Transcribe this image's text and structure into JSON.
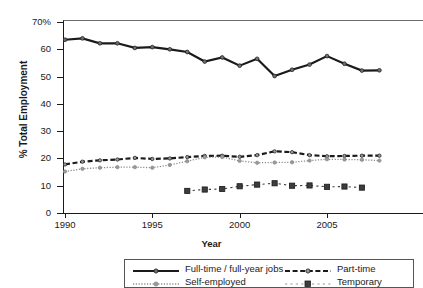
{
  "chart_data": {
    "type": "line",
    "title": "",
    "xlabel": "Year",
    "ylabel": "% Total Employment",
    "xlim": [
      1990,
      2008
    ],
    "ylim": [
      0,
      70
    ],
    "grid": false,
    "legend_position": "bottom",
    "x": [
      1990,
      1991,
      1992,
      1993,
      1994,
      1995,
      1996,
      1997,
      1998,
      1999,
      2000,
      2001,
      2002,
      2003,
      2004,
      2005,
      2006,
      2007,
      2008
    ],
    "yticks": [
      {
        "value": 70,
        "label": "70%"
      },
      {
        "value": 60,
        "label": "60"
      },
      {
        "value": 50,
        "label": "50"
      },
      {
        "value": 40,
        "label": "40"
      },
      {
        "value": 30,
        "label": "30"
      },
      {
        "value": 20,
        "label": "20"
      },
      {
        "value": 10,
        "label": "10"
      },
      {
        "value": 0,
        "label": "0"
      }
    ],
    "xticks": [
      {
        "value": 1990,
        "label": "1990"
      },
      {
        "value": 1995,
        "label": "1995"
      },
      {
        "value": 2000,
        "label": "2000"
      },
      {
        "value": 2005,
        "label": "2005"
      }
    ],
    "series": [
      {
        "name": "Full-time / full-year jobs",
        "style": "solid",
        "marker": "circle",
        "color": "#1a1a1a",
        "x": [
          1990,
          1991,
          1992,
          1993,
          1994,
          1995,
          1996,
          1997,
          1998,
          1999,
          2000,
          2001,
          2002,
          2003,
          2004,
          2005,
          2006,
          2007,
          2008
        ],
        "values": [
          63.5,
          64.0,
          62.2,
          62.2,
          60.5,
          60.8,
          60.0,
          59.0,
          55.5,
          57.0,
          54.0,
          56.5,
          50.2,
          52.5,
          54.4,
          57.5,
          54.7,
          52.2,
          52.3
        ]
      },
      {
        "name": "Part-time",
        "style": "dashed",
        "marker": "circle",
        "color": "#1a1a1a",
        "x": [
          1990,
          1991,
          1992,
          1993,
          1994,
          1995,
          1996,
          1997,
          1998,
          1999,
          2000,
          2001,
          2002,
          2003,
          2004,
          2005,
          2006,
          2007,
          2008
        ],
        "values": [
          17.8,
          18.8,
          19.3,
          19.6,
          20.2,
          19.8,
          20.0,
          20.5,
          20.9,
          21.0,
          20.6,
          21.2,
          22.6,
          22.3,
          21.2,
          20.8,
          20.9,
          21.0,
          21.0
        ]
      },
      {
        "name": "Self-employed",
        "style": "dotted",
        "marker": "circle",
        "color": "#8a8a8a",
        "x": [
          1990,
          1991,
          1992,
          1993,
          1994,
          1995,
          1996,
          1997,
          1998,
          1999,
          2000,
          2001,
          2002,
          2003,
          2004,
          2005,
          2006,
          2007,
          2008
        ],
        "values": [
          15.2,
          16.2,
          16.6,
          16.8,
          16.8,
          16.6,
          17.6,
          19.0,
          20.4,
          20.5,
          19.1,
          18.4,
          18.5,
          18.6,
          19.2,
          19.7,
          19.6,
          19.5,
          19.2
        ]
      },
      {
        "name": "Temporary",
        "style": "loose-dash",
        "marker": "square",
        "color": "#3d3d3d",
        "x": [
          1997,
          1998,
          1999,
          2000,
          2001,
          2002,
          2003,
          2004,
          2005,
          2006,
          2007
        ],
        "values": [
          8.1,
          8.6,
          8.8,
          9.8,
          10.4,
          10.9,
          10.0,
          10.1,
          9.6,
          9.7,
          9.3
        ]
      }
    ]
  },
  "legend": {
    "items": [
      {
        "label": "Full-time / full-year jobs",
        "key": "solid-circle"
      },
      {
        "label": "Part-time",
        "key": "dashed-circle"
      },
      {
        "label": "Self-employed",
        "key": "dotted-circle"
      },
      {
        "label": "Temporary",
        "key": "loose-dash-square"
      }
    ]
  }
}
